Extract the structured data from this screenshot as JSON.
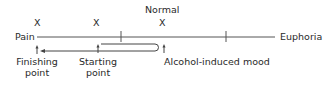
{
  "diagram": {
    "scale": {
      "left_label": "Pain",
      "right_label": "Euphoria",
      "top_label": "Normal"
    },
    "markers": [
      {
        "symbol": "X",
        "position": "finishing"
      },
      {
        "symbol": "X",
        "position": "starting"
      },
      {
        "symbol": "X",
        "position": "normal"
      }
    ],
    "annotations": {
      "finishing_point_line1": "Finishing",
      "finishing_point_line2": "point",
      "starting_point_line1": "Starting",
      "starting_point_line2": "point",
      "alcohol_mood": "Alcohol-induced mood"
    },
    "colors": {
      "line": "#444444",
      "text": "#2a2a2a",
      "background": "#ffffff"
    }
  }
}
